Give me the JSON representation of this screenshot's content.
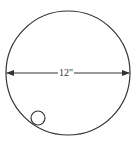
{
  "diagram": {
    "large_circle": {
      "cx": 68,
      "cy": 73,
      "r": 62,
      "stroke": "#333333"
    },
    "small_circle": {
      "cx": 38,
      "cy": 118,
      "r": 7,
      "stroke": "#333333"
    },
    "diameter_arrow": {
      "x1": 7,
      "x2": 129,
      "y": 73,
      "stroke": "#333333"
    },
    "diameter_label": "12\""
  }
}
